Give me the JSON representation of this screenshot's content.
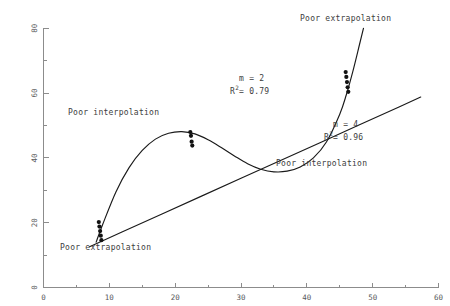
{
  "chart_data": {
    "type": "line",
    "title": "",
    "subtitle": "",
    "xlabel": "",
    "ylabel": "",
    "xlim": [
      0,
      60
    ],
    "ylim": [
      0,
      80
    ],
    "grid": false,
    "legend_position": "none",
    "x_ticks_major": [
      0,
      10,
      20,
      30,
      40,
      50,
      60
    ],
    "x_ticks_minor": [
      5,
      15,
      25,
      35,
      45,
      55
    ],
    "y_ticks_major": [
      0,
      20,
      40,
      60,
      80
    ],
    "y_ticks_minor": [
      10,
      30,
      50,
      70
    ],
    "x_tick_labels": [
      "0",
      "10",
      "20",
      "30",
      "40",
      "50",
      "60"
    ],
    "y_tick_labels": [
      "0",
      "20",
      "40",
      "60",
      "80"
    ],
    "series": [
      {
        "name": "m = 2",
        "kind": "fit-line",
        "degree": 2,
        "r_squared": 0.79,
        "description": "near-linear fit, straight ascending line",
        "x": [
          7.0,
          12.0,
          18.0,
          24.0,
          30.0,
          36.0,
          42.0,
          48.0,
          54.0,
          57.3
        ],
        "y": [
          12.6,
          17.2,
          22.7,
          28.2,
          33.7,
          39.2,
          44.7,
          50.2,
          55.7,
          58.8
        ]
      },
      {
        "name": "m = 4",
        "kind": "fit-curve",
        "degree": 4,
        "r_squared": 0.96,
        "description": "quartic fit with hump near x=21, dip near x=35, steep rise after x=45",
        "x": [
          8.0,
          9.0,
          11.0,
          13.0,
          15.0,
          17.0,
          19.0,
          21.0,
          23.0,
          25.0,
          27.0,
          29.0,
          31.0,
          33.0,
          35.0,
          37.0,
          39.0,
          41.0,
          43.0,
          45.0,
          46.0,
          47.0,
          48.0,
          48.6
        ],
        "y": [
          14.0,
          19.5,
          29.5,
          37.0,
          42.3,
          45.8,
          47.6,
          48.1,
          47.4,
          45.6,
          43.2,
          40.6,
          38.2,
          36.5,
          35.7,
          35.9,
          37.2,
          40.0,
          45.0,
          53.5,
          59.5,
          66.8,
          75.0,
          80.0
        ]
      }
    ],
    "data_points": [
      {
        "cluster": "left",
        "x": 8.4,
        "y": 20.2
      },
      {
        "cluster": "left",
        "x": 8.5,
        "y": 18.8
      },
      {
        "cluster": "left",
        "x": 8.6,
        "y": 17.4
      },
      {
        "cluster": "left",
        "x": 8.7,
        "y": 16.0
      },
      {
        "cluster": "left",
        "x": 8.8,
        "y": 14.6
      },
      {
        "cluster": "middle",
        "x": 22.3,
        "y": 48.0
      },
      {
        "cluster": "middle",
        "x": 22.4,
        "y": 46.8
      },
      {
        "cluster": "middle",
        "x": 22.5,
        "y": 45.0
      },
      {
        "cluster": "middle",
        "x": 22.6,
        "y": 43.8
      },
      {
        "cluster": "right",
        "x": 45.9,
        "y": 66.5
      },
      {
        "cluster": "right",
        "x": 46.0,
        "y": 65.0
      },
      {
        "cluster": "right",
        "x": 46.1,
        "y": 63.4
      },
      {
        "cluster": "right",
        "x": 46.2,
        "y": 61.8
      },
      {
        "cluster": "right",
        "x": 46.3,
        "y": 60.4
      }
    ],
    "annotations": [
      {
        "id": "poor-extrapolation-top",
        "text": "Poor extrapolation",
        "x": 41.0,
        "y": 78.0
      },
      {
        "id": "poor-interpolation-left",
        "text": "Poor interpolation",
        "x": 14.5,
        "y": 53.0
      },
      {
        "id": "poor-interpolation-right",
        "text": "Poor interpolation",
        "x": 38.5,
        "y": 33.5
      },
      {
        "id": "poor-extrapolation-bottom",
        "text": "Poor extrapolation",
        "x": 12.5,
        "y": 8.0
      }
    ],
    "equation_labels": [
      {
        "id": "fit-m2",
        "m_label": "m = 2",
        "r2_lead": "R",
        "r2_sup": "2",
        "r2_value": "= 0.79",
        "x": 35.0,
        "y": 59.0
      },
      {
        "id": "fit-m4",
        "m_label": "m = 4",
        "r2_lead": "R",
        "r2_sup": "2",
        "r2_value": "= 0.96",
        "x": 49.5,
        "y": 44.0
      }
    ]
  },
  "annotations": {
    "poor_extrapolation_top": "Poor extrapolation",
    "poor_interpolation_left": "Poor interpolation",
    "poor_interpolation_right": "Poor interpolation",
    "poor_extrapolation_bottom": "Poor extrapolation"
  },
  "equations": {
    "m2": {
      "m": "m = 2",
      "r_lead": "R",
      "r_sup": "2",
      "r_value": "= 0.79"
    },
    "m4": {
      "m": "m = 4",
      "r_lead": "R",
      "r_sup": "2",
      "r_value": "= 0.96"
    }
  },
  "axes": {
    "x_labels": [
      "0",
      "10",
      "20",
      "30",
      "40",
      "50",
      "60"
    ],
    "y_labels": [
      "0",
      "20",
      "40",
      "60",
      "80"
    ]
  },
  "colors": {
    "axis": "#8c8c8c",
    "tick_text": "#58595b",
    "curve": "#1a1a1a",
    "point": "#121212",
    "annotation_text": "#3d3d3d",
    "background": "#ffffff"
  }
}
